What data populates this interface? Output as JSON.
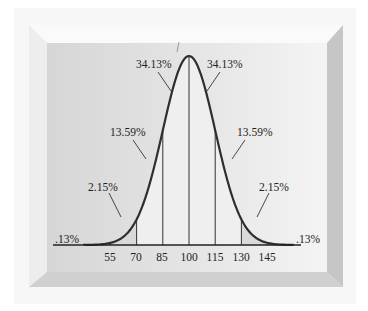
{
  "chart_data": {
    "type": "area",
    "title": "",
    "xlabel": "",
    "ylabel": "",
    "distribution": "normal",
    "mean": 100,
    "sd": 15,
    "x_ticks": [
      55,
      70,
      85,
      100,
      115,
      130,
      145
    ],
    "regions": [
      {
        "from": "-inf",
        "to": 55,
        "percent": ".13%"
      },
      {
        "from": 55,
        "to": 70,
        "percent": "2.15%"
      },
      {
        "from": 70,
        "to": 85,
        "percent": "13.59%"
      },
      {
        "from": 85,
        "to": 100,
        "percent": "34.13%"
      },
      {
        "from": 100,
        "to": 115,
        "percent": "34.13%"
      },
      {
        "from": 115,
        "to": 130,
        "percent": "13.59%"
      },
      {
        "from": 130,
        "to": 145,
        "percent": "2.15%"
      },
      {
        "from": 145,
        "to": "inf",
        "percent": ".13%"
      }
    ],
    "grid": false,
    "legend": null
  },
  "labels": {
    "ticks": [
      "55",
      "70",
      "85",
      "100",
      "115",
      "130",
      "145"
    ],
    "left_tail": ".13%",
    "left_outer": "2.15%",
    "left_mid": "13.59%",
    "left_inner": "34.13%",
    "right_inner": "34.13%",
    "right_mid": "13.59%",
    "right_outer": "2.15%",
    "right_tail": ".13%"
  },
  "colors": {
    "background": "#ffffff",
    "frame_top": "#f4f4f4",
    "frame_left": "#ececec",
    "frame_right": "#c4c4c4",
    "frame_bottom": "#cdcdcd",
    "panel_left": "#d7d7d7",
    "panel_right": "#f3f3f3",
    "curve_fill": "#eeeeee",
    "tail_fill": "#d9d9d9",
    "curve_stroke": "#2e2e2e",
    "text": "#222222"
  }
}
